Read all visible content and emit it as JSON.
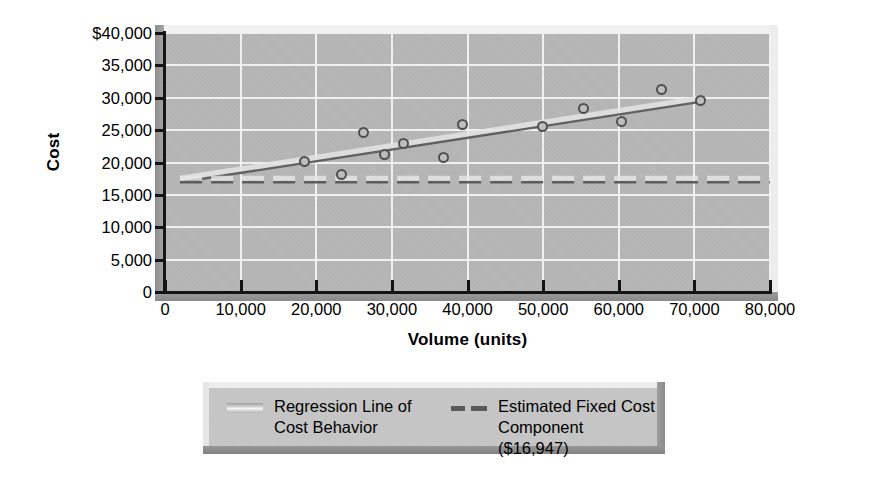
{
  "chart_data": {
    "type": "scatter",
    "title": "",
    "xlabel": "Volume (units)",
    "ylabel": "Cost",
    "xlim": [
      0,
      80000
    ],
    "ylim": [
      0,
      40000
    ],
    "grid": true,
    "x_ticks": [
      0,
      10000,
      20000,
      30000,
      40000,
      50000,
      60000,
      70000,
      80000
    ],
    "x_ticklabels": [
      "0",
      "10,000",
      "20,000",
      "30,000",
      "40,000",
      "50,000",
      "60,000",
      "70,000",
      "80,000"
    ],
    "y_ticks": [
      0,
      5000,
      10000,
      15000,
      20000,
      25000,
      30000,
      35000,
      40000
    ],
    "y_ticklabels": [
      "0",
      "5,000",
      "10,000",
      "15,000",
      "20,000",
      "25,000",
      "30,000",
      "35,000",
      "$40,000"
    ],
    "legend_position": "below-plot",
    "series": [
      {
        "name": "Observed Cost Data Points",
        "type": "scatter",
        "marker": "open-circle",
        "points": [
          {
            "x": 18400,
            "y": 20100
          },
          {
            "x": 23400,
            "y": 18100
          },
          {
            "x": 26200,
            "y": 24700
          },
          {
            "x": 29000,
            "y": 21200
          },
          {
            "x": 31600,
            "y": 23000
          },
          {
            "x": 36800,
            "y": 20700
          },
          {
            "x": 39400,
            "y": 25900
          },
          {
            "x": 49900,
            "y": 25500
          },
          {
            "x": 55300,
            "y": 28400
          },
          {
            "x": 60400,
            "y": 26400
          },
          {
            "x": 65600,
            "y": 31200
          },
          {
            "x": 70800,
            "y": 29600
          }
        ]
      },
      {
        "name": "Regression Line of Cost Behavior",
        "type": "line",
        "style": "solid",
        "intercept": 16947,
        "x_start": 2000,
        "x_end": 71000,
        "y_start": 16947,
        "y_end": 29400
      },
      {
        "name": "Estimated Fixed Cost Component ($16,947)",
        "type": "line",
        "style": "dashed",
        "value": 16947,
        "x_start": 2000,
        "x_end": 80000
      }
    ],
    "legend": [
      {
        "label": "Regression Line of\nCost Behavior",
        "swatch": "solid"
      },
      {
        "label": "Estimated Fixed Cost\nComponent ($16,947)",
        "swatch": "dashed"
      }
    ],
    "colors": {
      "plot_background": "#b4b4b4",
      "gridline": "#f0f0f0",
      "axis": "#141414",
      "marker_edge": "#4d4d4d",
      "regression_line": "#5e5e5e",
      "fixed_cost_line": "#5a5a5a",
      "legend_background": "#c4c4c4",
      "page_background": "#ffffff"
    }
  }
}
